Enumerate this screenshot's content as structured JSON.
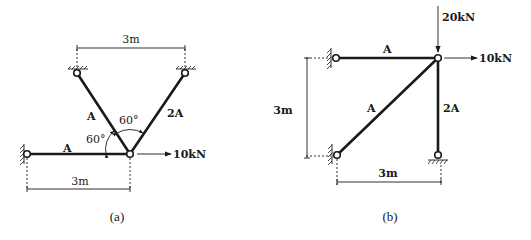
{
  "figures": [
    {
      "id": "a",
      "caption": "(a)",
      "members": [
        {
          "name": "horizontal-bar",
          "area_label": "A"
        },
        {
          "name": "left-inclined-bar",
          "area_label": "A"
        },
        {
          "name": "right-inclined-bar",
          "area_label": "2A"
        }
      ],
      "angles": [
        "60°",
        "60°"
      ],
      "load": {
        "value": "10kN",
        "direction": "right"
      },
      "dimensions": {
        "top": "3m",
        "bottom": "3m"
      }
    },
    {
      "id": "b",
      "caption": "(b)",
      "members": [
        {
          "name": "top-horizontal-bar",
          "area_label": "A"
        },
        {
          "name": "diagonal-bar",
          "area_label": "A"
        },
        {
          "name": "vertical-bar",
          "area_label": "2A"
        }
      ],
      "loads": [
        {
          "value": "20kN",
          "direction": "down"
        },
        {
          "value": "10kN",
          "direction": "right"
        }
      ],
      "dimensions": {
        "left": "3m",
        "bottom": "3m"
      }
    }
  ],
  "colors": {
    "ink": "#1a1a1a",
    "background": "#ffffff"
  }
}
